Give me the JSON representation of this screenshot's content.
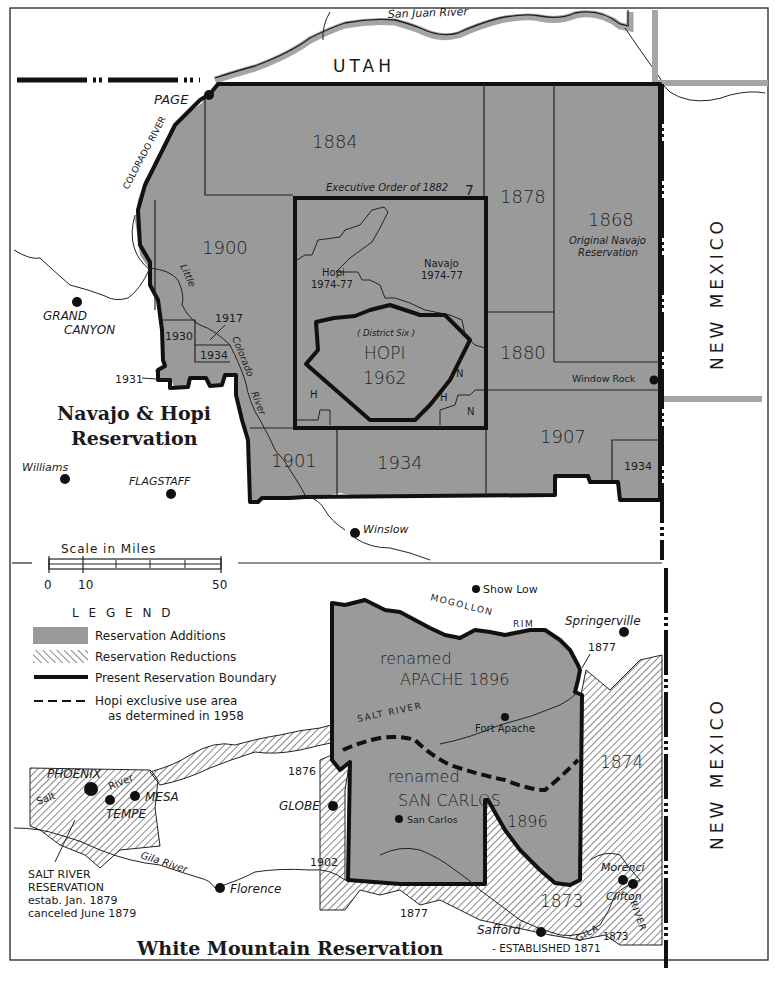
{
  "colors": {
    "addition_fill": "#9a9a9a",
    "boundary": "#111111",
    "paper": "#ffffff",
    "border_band": "#a5a5a5"
  },
  "maps": {
    "navajo_hopi": {
      "title_line1": "Navajo & Hopi",
      "title_line2": "Reservation",
      "state_labels": {
        "utah": "UTAH",
        "new_mexico": "NEW MEXICO"
      },
      "rivers": {
        "san_juan": "San Juan River",
        "colorado": "COLORADO RIVER",
        "little": "Little",
        "little_colorado": "Colorado",
        "little_river": "River"
      },
      "areas": [
        {
          "label": "1884"
        },
        {
          "label": "1878"
        },
        {
          "label": "1868",
          "sub1": "Original Navajo",
          "sub2": "Reservation"
        },
        {
          "label": "1900"
        },
        {
          "label": "1880"
        },
        {
          "label": "1907"
        },
        {
          "label": "1901"
        },
        {
          "label": "1934"
        },
        {
          "label": "1934"
        },
        {
          "label": "1930"
        },
        {
          "label": "1934"
        },
        {
          "label": "1917"
        },
        {
          "label": "1931"
        }
      ],
      "exec_order": "Executive Order of 1882",
      "exec_order_mark": "7",
      "hopi_1974": {
        "name": "Hopi",
        "years": "1974-77"
      },
      "navajo_1974": {
        "name": "Navajo",
        "years": "1974-77"
      },
      "district_six": "( District Six )",
      "hopi_1962_name": "HOPI",
      "hopi_1962_year": "1962",
      "small_marks": [
        "H",
        "H",
        "N",
        "N"
      ],
      "towns": {
        "page": "PAGE",
        "grand_canyon_1": "GRAND",
        "grand_canyon_2": "CANYON",
        "window_rock": "Window Rock",
        "williams": "Williams",
        "flagstaff": "FLAGSTAFF",
        "winslow": "Winslow"
      }
    },
    "scale": {
      "title": "Scale   in   Miles",
      "ticks": [
        "0",
        "10",
        "50"
      ]
    },
    "legend": {
      "title": "L E G E N D",
      "items": [
        {
          "label": "Reservation Additions"
        },
        {
          "label": "Reservation Reductions"
        },
        {
          "label": "Present Reservation Boundary"
        },
        {
          "label": "Hopi exclusive use area",
          "label2": "as determined in 1958"
        }
      ]
    },
    "white_mountain": {
      "title": "White Mountain Reservation",
      "established": "- ESTABLISHED 1871",
      "state_label": "NEW MEXICO",
      "apache_renamed": "renamed",
      "apache_name": "APACHE 1896",
      "san_carlos_renamed": "renamed",
      "san_carlos_name": "SAN CARLOS",
      "san_carlos_year": "1896",
      "mogollon": "MOGOLLON",
      "rim": "RIM",
      "salt_river": "SALT RIVER",
      "gila": "GILA",
      "river": "RIVER",
      "years": {
        "y1877a": "1877",
        "y1874": "1874",
        "y1876": "1876",
        "y1902": "1902",
        "y1877b": "1877",
        "y1873a": "1873",
        "y1873b": "1873"
      },
      "towns": {
        "show_low": "Show Low",
        "springerville": "Springerville",
        "fort_apache": "Fort Apache",
        "san_carlos": "San Carlos",
        "globe": "GLOBE",
        "phoenix": "PHOENIX",
        "mesa": "MESA",
        "tempe": "TEMPE",
        "florence": "Florence",
        "safford": "Safford",
        "morenci": "Morenci",
        "clifton": "Clifton"
      },
      "salt_label": "Salt",
      "river_label": "River",
      "gila_river": "Gila River",
      "salt_river_res": {
        "line1": "SALT RIVER",
        "line2": "RESERVATION",
        "line3": "estab. Jan. 1879",
        "line4": "canceled June 1879"
      }
    }
  }
}
